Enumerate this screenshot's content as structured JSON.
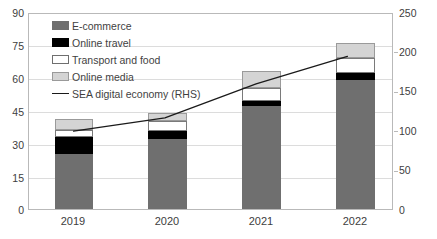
{
  "chart_data": {
    "type": "bar",
    "title": "",
    "subtitle": "",
    "xlabel": "",
    "ylabel": "",
    "y2label": "",
    "categories": [
      "2019",
      "2020",
      "2021",
      "2022"
    ],
    "stacked": true,
    "ylim": [
      0,
      90
    ],
    "y2lim": [
      0,
      250
    ],
    "yticks": [
      0,
      15,
      30,
      45,
      60,
      75,
      90
    ],
    "y2ticks": [
      0,
      50,
      100,
      150,
      200,
      250
    ],
    "grid": true,
    "legend_position": "top-left",
    "series": [
      {
        "name": "E-commerce",
        "axis": "left",
        "type": "bar",
        "color": "#6f6f6f",
        "values": [
          25,
          32,
          47,
          59
        ]
      },
      {
        "name": "Online travel",
        "axis": "left",
        "type": "bar",
        "color": "#000000",
        "values": [
          8,
          3.5,
          2.5,
          3
        ]
      },
      {
        "name": "Transport and food",
        "axis": "left",
        "type": "bar",
        "color": "#ffffff",
        "values": [
          3,
          4.5,
          6,
          7
        ]
      },
      {
        "name": "Online media",
        "axis": "left",
        "type": "bar",
        "color": "#d4d4d4",
        "values": [
          5,
          4,
          7.5,
          7
        ]
      },
      {
        "name": "SEA digital economy (RHS)",
        "axis": "right",
        "type": "line",
        "color": "#1a1a1a",
        "values": [
          100,
          117,
          160,
          195
        ]
      }
    ],
    "bar_totals": [
      41,
      44,
      63,
      76
    ]
  },
  "axes": {
    "left_ticks": [
      "90",
      "75",
      "60",
      "45",
      "30",
      "15",
      "0"
    ],
    "right_ticks": [
      "250",
      "200",
      "150",
      "100",
      "50",
      "0"
    ],
    "category_labels": [
      "2019",
      "2020",
      "2021",
      "2022"
    ]
  },
  "legend": {
    "items": [
      {
        "label": "E-commerce",
        "icon": "legend-swatch-ecommerce"
      },
      {
        "label": "Online travel",
        "icon": "legend-swatch-online-travel"
      },
      {
        "label": "Transport and food",
        "icon": "legend-swatch-transport-food"
      },
      {
        "label": "Online media",
        "icon": "legend-swatch-online-media"
      },
      {
        "label": "SEA digital economy (RHS)",
        "icon": "legend-line-marker"
      }
    ]
  },
  "colors": {
    "ecommerce": "#6f6f6f",
    "online_travel": "#000000",
    "transport_and_food": "#ffffff",
    "online_media": "#d4d4d4",
    "line": "#1a1a1a",
    "grid": "#dcdcdc",
    "frame": "#b9b9b9",
    "text": "#404040",
    "background": "#ffffff"
  }
}
